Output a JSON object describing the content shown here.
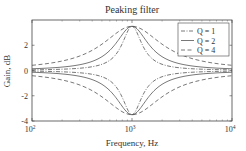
{
  "chart_data": {
    "type": "line",
    "title": "Peaking filter",
    "xlabel": "Frequency, Hz",
    "ylabel": "Gain, dB",
    "xscale": "log",
    "xlim": [
      100,
      10000
    ],
    "ylim": [
      -4,
      4
    ],
    "xticks": [
      100,
      1000,
      10000
    ],
    "xtick_labels": [
      {
        "base": "10",
        "exp": "2"
      },
      {
        "base": "10",
        "exp": "3"
      },
      {
        "base": "10",
        "exp": "4"
      }
    ],
    "yticks": [
      -4,
      -2,
      0,
      2
    ],
    "ytick_labels": [
      "-4",
      "-2",
      "0",
      "2"
    ],
    "center_frequency_hz": 1000,
    "peak_gain_db": 3.5,
    "grid": false,
    "legend_position": "upper right",
    "series": [
      {
        "name": "Q = 1",
        "style": "dashdot",
        "bandwidth_factor": 0.6,
        "gain_db": [
          3.5,
          -3.5
        ]
      },
      {
        "name": "Q = 2",
        "style": "solid",
        "bandwidth_factor": 1.0,
        "gain_db": [
          3.5,
          -3.5
        ]
      },
      {
        "name": "Q = 4",
        "style": "dashed",
        "bandwidth_factor": 1.8,
        "gain_db": [
          3.5,
          -3.5
        ]
      }
    ],
    "legend": [
      "Q = 1",
      "Q = 2",
      "Q = 4"
    ]
  },
  "colors": {
    "line": "#555555",
    "axis": "#444444",
    "text": "#333333"
  }
}
